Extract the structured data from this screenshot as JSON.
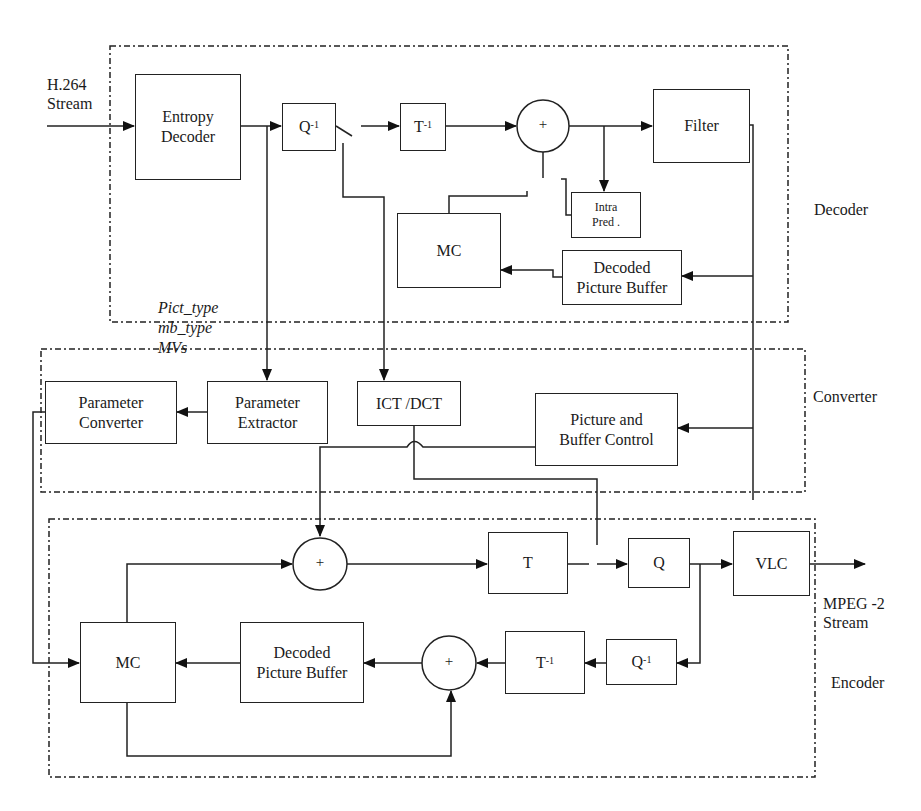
{
  "diagram": {
    "sections": {
      "decoder": "Decoder",
      "converter": "Converter",
      "encoder": "Encoder"
    },
    "input_label": [
      "H.264",
      "Stream"
    ],
    "output_label": [
      "MPEG -2",
      "Stream"
    ],
    "side_info": [
      "Pict_type",
      "mb_type",
      "MVs"
    ],
    "decoder_blocks": {
      "entropy_decoder": [
        "Entropy",
        "Decoder"
      ],
      "inverse_quant": "Q",
      "inverse_quant_sup": "-1",
      "inverse_transform": "T",
      "inverse_transform_sup": "-1",
      "adder": "+",
      "filter": "Filter",
      "intra_pred": [
        "Intra",
        "Pred ."
      ],
      "mc": "MC",
      "dpb": [
        "Decoded",
        "Picture Buffer"
      ]
    },
    "converter_blocks": {
      "parameter_converter": [
        "Parameter",
        "Converter"
      ],
      "parameter_extractor": [
        "Parameter",
        "Extractor"
      ],
      "ict_dct": "ICT /DCT",
      "picture_buffer_control": [
        "Picture and",
        "Buffer Control"
      ]
    },
    "encoder_blocks": {
      "adder": "+",
      "transform": "T",
      "quant": "Q",
      "vlc": "VLC",
      "mc": "MC",
      "dpb": [
        "Decoded",
        "Picture Buffer"
      ],
      "adder2": "+",
      "inverse_transform": "T",
      "inverse_transform_sup": "-1",
      "inverse_quant": "Q",
      "inverse_quant_sup": "-1"
    }
  }
}
